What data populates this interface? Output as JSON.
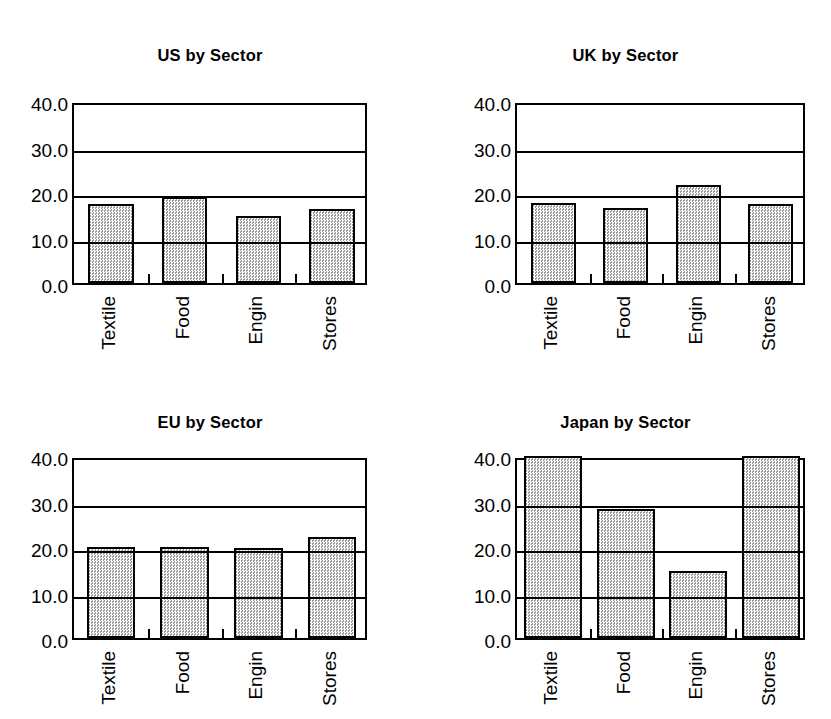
{
  "figure": {
    "background_color": "#ffffff",
    "ink_color": "#000000",
    "bar_fill_color": "#d2d2d2",
    "bar_edge_color": "#000000",
    "panel_count": 4
  },
  "charts": [
    {
      "id": "us",
      "title": "US by Sector",
      "categories": [
        "Textile",
        "Food",
        "Engin",
        "Stores"
      ],
      "values": [
        17.4,
        19.0,
        14.8,
        16.3
      ],
      "yticks": [
        "40.0",
        "30.0",
        "20.0",
        "10.0",
        "0.0"
      ],
      "ymin": 0,
      "ymax": 40
    },
    {
      "id": "uk",
      "title": "UK by Sector",
      "categories": [
        "Textile",
        "Food",
        "Engin",
        "Stores"
      ],
      "values": [
        17.5,
        16.5,
        21.5,
        17.3
      ],
      "yticks": [
        "40.0",
        "30.0",
        "20.0",
        "10.0",
        "0.0"
      ],
      "ymin": 0,
      "ymax": 40
    },
    {
      "id": "eu",
      "title": "EU by Sector",
      "categories": [
        "Textile",
        "Food",
        "Engin",
        "Stores"
      ],
      "values": [
        20.0,
        20.0,
        19.8,
        22.3
      ],
      "yticks": [
        "40.0",
        "30.0",
        "20.0",
        "10.0",
        "0.0"
      ],
      "ymin": 0,
      "ymax": 40
    },
    {
      "id": "japan",
      "title": "Japan by Sector",
      "categories": [
        "Textile",
        "Food",
        "Engin",
        "Stores"
      ],
      "values": [
        40.0,
        28.3,
        14.8,
        39.9
      ],
      "yticks": [
        "40.0",
        "30.0",
        "20.0",
        "10.0",
        "0.0"
      ],
      "ymin": 0,
      "ymax": 40
    }
  ],
  "chart_data": [
    {
      "type": "bar",
      "title": "US by Sector",
      "categories": [
        "Textile",
        "Food",
        "Engin",
        "Stores"
      ],
      "values": [
        17.4,
        19.0,
        14.8,
        16.3
      ],
      "xlabel": "",
      "ylabel": "",
      "ylim": [
        0,
        40
      ],
      "yticks": [
        0,
        10,
        20,
        30,
        40
      ],
      "ytick_labels": [
        "0.0",
        "10.0",
        "20.0",
        "30.0",
        "40.0"
      ],
      "grid": true,
      "legend": false
    },
    {
      "type": "bar",
      "title": "UK by Sector",
      "categories": [
        "Textile",
        "Food",
        "Engin",
        "Stores"
      ],
      "values": [
        17.5,
        16.5,
        21.5,
        17.3
      ],
      "xlabel": "",
      "ylabel": "",
      "ylim": [
        0,
        40
      ],
      "yticks": [
        0,
        10,
        20,
        30,
        40
      ],
      "ytick_labels": [
        "0.0",
        "10.0",
        "20.0",
        "30.0",
        "40.0"
      ],
      "grid": true,
      "legend": false
    },
    {
      "type": "bar",
      "title": "EU by Sector",
      "categories": [
        "Textile",
        "Food",
        "Engin",
        "Stores"
      ],
      "values": [
        20.0,
        20.0,
        19.8,
        22.3
      ],
      "xlabel": "",
      "ylabel": "",
      "ylim": [
        0,
        40
      ],
      "yticks": [
        0,
        10,
        20,
        30,
        40
      ],
      "ytick_labels": [
        "0.0",
        "10.0",
        "20.0",
        "30.0",
        "40.0"
      ],
      "grid": true,
      "legend": false
    },
    {
      "type": "bar",
      "title": "Japan by Sector",
      "categories": [
        "Textile",
        "Food",
        "Engin",
        "Stores"
      ],
      "values": [
        40.0,
        28.3,
        14.8,
        39.9
      ],
      "xlabel": "",
      "ylabel": "",
      "ylim": [
        0,
        40
      ],
      "yticks": [
        0,
        10,
        20,
        30,
        40
      ],
      "ytick_labels": [
        "0.0",
        "10.0",
        "20.0",
        "30.0",
        "40.0"
      ],
      "grid": true,
      "legend": false
    }
  ]
}
